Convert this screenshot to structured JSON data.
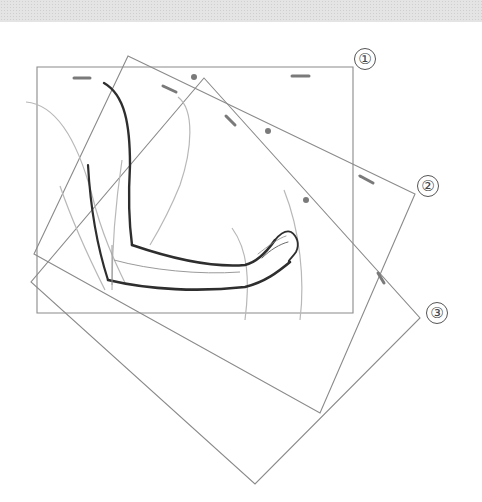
{
  "figure": {
    "type": "animation-frame-rotation-diagram",
    "background_band": {
      "color": "#e4e4e4"
    },
    "colors": {
      "frame_line": "#8a8a8a",
      "peg_mark": "#7a7a7a",
      "sketch_dark": "#2e2e2e",
      "sketch_light": "#b8b8b8"
    },
    "frames": [
      {
        "id": 1,
        "label": "①",
        "points": [
          [
            37,
            67
          ],
          [
            353,
            67
          ],
          [
            353,
            313
          ],
          [
            37,
            313
          ]
        ],
        "label_pos": [
          354,
          48
        ]
      },
      {
        "id": 2,
        "label": "②",
        "points": [
          [
            128,
            56
          ],
          [
            415,
            194
          ],
          [
            320,
            413
          ],
          [
            34,
            254
          ]
        ],
        "label_pos": [
          417,
          175
        ]
      },
      {
        "id": 3,
        "label": "③",
        "points": [
          [
            204,
            78
          ],
          [
            420,
            318
          ],
          [
            255,
            484
          ],
          [
            31,
            282
          ]
        ],
        "label_pos": [
          426,
          302
        ]
      }
    ],
    "peg_marks": {
      "dashes": [
        {
          "x1": 74,
          "y1": 78,
          "x2": 90,
          "y2": 78
        },
        {
          "x1": 163,
          "y1": 86,
          "x2": 176,
          "y2": 92
        },
        {
          "x1": 292,
          "y1": 76,
          "x2": 309,
          "y2": 76
        },
        {
          "x1": 226,
          "y1": 116,
          "x2": 235,
          "y2": 125
        },
        {
          "x1": 360,
          "y1": 176,
          "x2": 373,
          "y2": 183
        },
        {
          "x1": 378,
          "y1": 273,
          "x2": 384,
          "y2": 283
        }
      ],
      "dots": [
        {
          "cx": 194,
          "cy": 77
        },
        {
          "cx": 268,
          "cy": 131
        },
        {
          "cx": 306,
          "cy": 200
        }
      ]
    }
  }
}
